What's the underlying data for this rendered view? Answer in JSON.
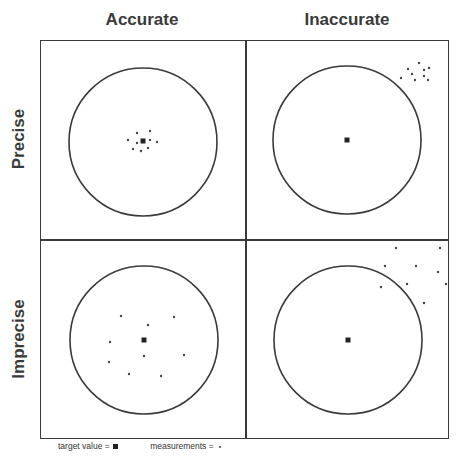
{
  "columns": [
    {
      "label": "Accurate"
    },
    {
      "label": "Inaccurate"
    }
  ],
  "rows": [
    {
      "label": "Precise"
    },
    {
      "label": "Imprecise"
    }
  ],
  "legend": {
    "target_label": "target value =",
    "measurement_label": "measurements ="
  },
  "colors": {
    "line": "#3a3a3a",
    "target": "#222222",
    "measurement": "#444444"
  },
  "panels": [
    {
      "name": "accurate-precise",
      "circle": {
        "cx": 102,
        "cy": 101,
        "r": 74
      },
      "target": {
        "x": 102,
        "y": 100
      },
      "measurements": [
        [
          96,
          92
        ],
        [
          109,
          90
        ],
        [
          87,
          99
        ],
        [
          96,
          102
        ],
        [
          109,
          99
        ],
        [
          116,
          101
        ],
        [
          92,
          108
        ],
        [
          100,
          110
        ],
        [
          107,
          107
        ]
      ]
    },
    {
      "name": "inaccurate-precise",
      "circle": {
        "cx": 101,
        "cy": 99,
        "r": 74
      },
      "target": {
        "x": 101,
        "y": 99
      },
      "measurements": [
        [
          173,
          22
        ],
        [
          162,
          28
        ],
        [
          183,
          27
        ],
        [
          166,
          33
        ],
        [
          178,
          29
        ],
        [
          155,
          37
        ],
        [
          169,
          39
        ],
        [
          178,
          35
        ],
        [
          182,
          39
        ]
      ]
    },
    {
      "name": "accurate-imprecise",
      "circle": {
        "cx": 103,
        "cy": 101,
        "r": 74
      },
      "target": {
        "x": 103,
        "y": 101
      },
      "measurements": [
        [
          80,
          77
        ],
        [
          133,
          78
        ],
        [
          107,
          86
        ],
        [
          69,
          103
        ],
        [
          103,
          117
        ],
        [
          143,
          116
        ],
        [
          68,
          123
        ],
        [
          88,
          135
        ],
        [
          120,
          137
        ]
      ]
    },
    {
      "name": "inaccurate-imprecise",
      "circle": {
        "cx": 102,
        "cy": 101,
        "r": 74
      },
      "target": {
        "x": 102,
        "y": 101
      },
      "measurements": [
        [
          150,
          9
        ],
        [
          194,
          9
        ],
        [
          139,
          27
        ],
        [
          170,
          27
        ],
        [
          192,
          33
        ],
        [
          161,
          45
        ],
        [
          135,
          48
        ],
        [
          200,
          45
        ],
        [
          178,
          64
        ]
      ]
    }
  ]
}
